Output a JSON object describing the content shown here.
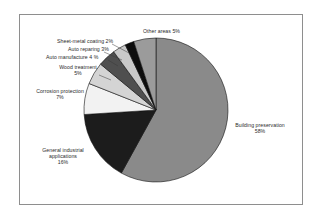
{
  "chart_data": {
    "type": "pie",
    "title": "",
    "subtitle": "",
    "xlabel": "",
    "ylabel": "",
    "legend_position": "none",
    "grid": false,
    "units": "percent",
    "start_angle_deg": 0,
    "direction": "clockwise",
    "categories": [
      "Building preservation",
      "General industrial applications",
      "Corrosion protection",
      "Wood treatment",
      "Auto manufacture",
      "Auto reparing",
      "Sheet-metal coating",
      "Other areas"
    ],
    "values": [
      58,
      16,
      7,
      5,
      4,
      3,
      2,
      5
    ],
    "slices": [
      {
        "label": "Building preservation",
        "value": 58,
        "value_text": "58%",
        "color": "#8a8a8a"
      },
      {
        "label": "General industrial applications",
        "value": 16,
        "value_text": "16%",
        "color": "#1c1c1c"
      },
      {
        "label": "Corrosion protection",
        "value": 7,
        "value_text": "7%",
        "color": "#f2f2f2"
      },
      {
        "label": "Wood treatment",
        "value": 5,
        "value_text": "5%",
        "color": "#d4d4d4"
      },
      {
        "label": "Auto manufacture",
        "value": 4,
        "value_text": "4 %",
        "color": "#4f4f4f"
      },
      {
        "label": "Auto reparing",
        "value": 3,
        "value_text": "3%",
        "color": "#c9c9c9"
      },
      {
        "label": "Sheet-metal coating",
        "value": 2,
        "value_text": "2%",
        "color": "#0d0d0d"
      },
      {
        "label": "Other areas",
        "value": 5,
        "value_text": "5%",
        "color": "#9b9b9b"
      }
    ]
  },
  "labels": {
    "other_areas": "Other areas  5%",
    "sheet_metal_coating": "Sheet-metal coating  2%",
    "auto_reparing": "Auto reparing  3%",
    "auto_manufacture": "Auto manufacture  4 %",
    "wood_treatment": "Wood treatment\n5%",
    "wood_treatment_name": "Wood treatment",
    "wood_treatment_value": "5%",
    "corrosion_protection_name": "Corrosion protection",
    "corrosion_protection_value": "7%",
    "general_industrial_line1": "General industrial",
    "general_industrial_line2": "applications",
    "general_industrial_value": "16%",
    "building_preservation_name": "Building preservation",
    "building_preservation_value": "58%"
  },
  "style": {
    "frame_color": "#8e8e8e",
    "background": "#ffffff",
    "text_color": "#2b2b2b",
    "slice_outline": "#111111"
  }
}
